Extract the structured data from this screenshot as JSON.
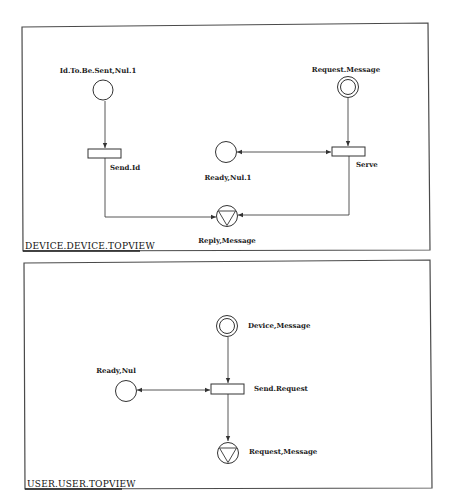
{
  "views": [
    {
      "title": "DEVICE.DEVICE.TOPVIEW",
      "places": [
        {
          "id": "id_to_be_sent",
          "label": "Id.To.Be.Sent,Nul.1",
          "type": "plain"
        },
        {
          "id": "request_message",
          "label": "Request.Message",
          "type": "input-double-circle"
        },
        {
          "id": "ready",
          "label": "Ready,Nul.1",
          "type": "plain"
        },
        {
          "id": "reply_message",
          "label": "Reply,Message",
          "type": "output-triangle"
        }
      ],
      "transitions": [
        {
          "id": "send_id",
          "label": "Send.Id"
        },
        {
          "id": "serve",
          "label": "Serve"
        }
      ],
      "arcs": [
        {
          "from": "Id.To.Be.Sent,Nul.1",
          "to": "Send.Id"
        },
        {
          "from": "Send.Id",
          "to": "Reply,Message"
        },
        {
          "from": "Request.Message",
          "to": "Serve"
        },
        {
          "from": "Serve",
          "to": "Reply,Message"
        },
        {
          "from": "Ready,Nul.1",
          "to": "Serve",
          "bidirectional": true
        }
      ]
    },
    {
      "title": "USER.USER.TOPVIEW",
      "places": [
        {
          "id": "device_message",
          "label": "Device,Message",
          "type": "input-double-circle"
        },
        {
          "id": "ready_nul",
          "label": "Ready,Nul",
          "type": "plain"
        },
        {
          "id": "request_message_out",
          "label": "Request,Message",
          "type": "output-triangle"
        }
      ],
      "transitions": [
        {
          "id": "send_request",
          "label": "Send.Request"
        }
      ],
      "arcs": [
        {
          "from": "Device,Message",
          "to": "Send.Request"
        },
        {
          "from": "Send.Request",
          "to": "Request,Message"
        },
        {
          "from": "Ready,Nul",
          "to": "Send.Request",
          "bidirectional": true
        }
      ]
    }
  ]
}
